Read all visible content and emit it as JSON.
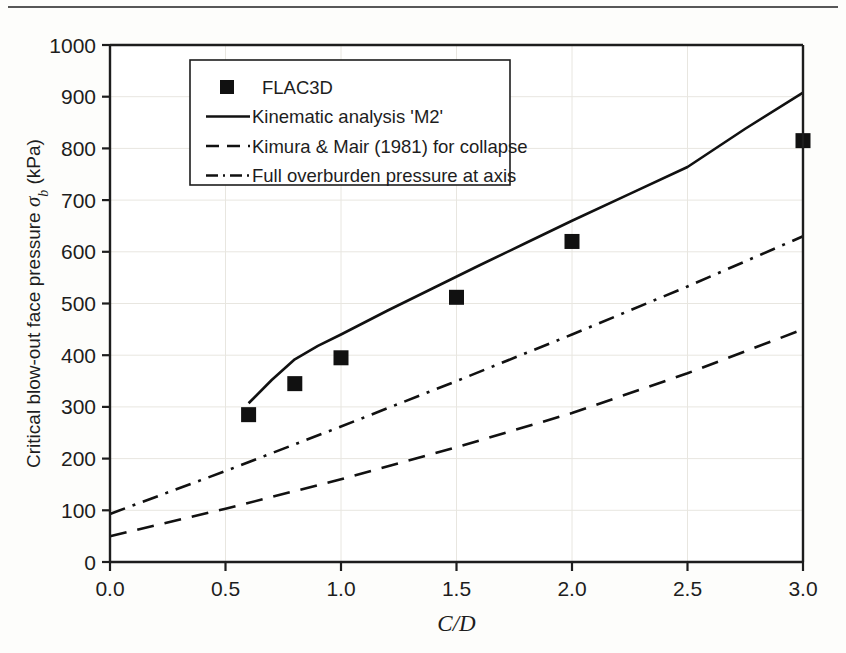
{
  "chart_data": {
    "type": "scatter",
    "title": "",
    "xlabel": "C/D",
    "ylabel": "Critical blow-out face pressure σb (kPa)",
    "ylabel_main": "Critical blow-out face pressure",
    "ylabel_symbol": "σ",
    "ylabel_subscript": "b",
    "ylabel_units": "(kPa)",
    "xlim": [
      0.0,
      3.0
    ],
    "ylim": [
      0,
      1000
    ],
    "xticks": [
      0.0,
      0.5,
      1.0,
      1.5,
      2.0,
      2.5,
      3.0
    ],
    "xtick_labels": [
      "0.0",
      "0.5",
      "1.0",
      "1.5",
      "2.0",
      "2.5",
      "3.0"
    ],
    "yticks": [
      0,
      100,
      200,
      300,
      400,
      500,
      600,
      700,
      800,
      900,
      1000
    ],
    "ytick_labels": [
      "0",
      "100",
      "200",
      "300",
      "400",
      "500",
      "600",
      "700",
      "800",
      "900",
      "1000"
    ],
    "grid": true,
    "grid_color": "#e8e6e0",
    "legend_position": "upper-left",
    "series": [
      {
        "name": "FLAC3D",
        "style": "marker",
        "marker": "square",
        "color": "#111111",
        "x": [
          0.6,
          0.8,
          1.0,
          1.5,
          2.0,
          3.0
        ],
        "values": [
          285,
          345,
          395,
          512,
          620,
          815
        ]
      },
      {
        "name": "Kinematic analysis 'M2'",
        "style": "solid",
        "color": "#111111",
        "x": [
          0.6,
          0.7,
          0.8,
          0.9,
          1.0,
          1.2,
          1.4,
          1.6,
          1.8,
          2.0,
          2.25,
          2.5,
          2.75,
          3.0
        ],
        "values": [
          307,
          352,
          392,
          418,
          440,
          486,
          530,
          574,
          617,
          660,
          712,
          764,
          838,
          908
        ]
      },
      {
        "name": "Kimura & Mair (1981) for collapse",
        "style": "dashed",
        "color": "#111111",
        "x": [
          0.0,
          0.5,
          1.0,
          1.5,
          2.0,
          2.5,
          3.0
        ],
        "values": [
          50,
          103,
          160,
          222,
          288,
          365,
          450
        ]
      },
      {
        "name": "Full overburden pressure at axis",
        "style": "dashdot",
        "color": "#111111",
        "x": [
          0.0,
          0.5,
          1.0,
          1.5,
          2.0,
          2.5,
          3.0
        ],
        "values": [
          93,
          176,
          262,
          350,
          440,
          533,
          630
        ]
      }
    ]
  },
  "legend": {
    "items": [
      {
        "label": "FLAC3D",
        "style": "marker"
      },
      {
        "label": "Kinematic analysis 'M2'",
        "style": "solid"
      },
      {
        "label": "Kimura & Mair (1981) for collapse",
        "style": "dashed"
      },
      {
        "label": "Full overburden pressure at axis",
        "style": "dashdot"
      }
    ]
  }
}
